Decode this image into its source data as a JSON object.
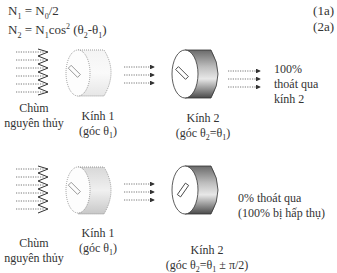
{
  "equations": [
    {
      "lhs": "N",
      "lhs_sub": "1",
      "rhs_a": " = N",
      "rhs_sub": "0",
      "rhs_b": "/2",
      "number": "(1a)"
    },
    {
      "lhs": "N",
      "lhs_sub": "2",
      "rhs_a": " = N",
      "rhs_sub": "1",
      "rhs_b": "cos",
      "sup": "2",
      "rhs_c": " (θ",
      "s2": "2",
      "rhs_d": "-θ",
      "s1": "1",
      "rhs_e": ")",
      "number": "(2a)"
    }
  ],
  "top_scenario": {
    "source_label": [
      "Chùm",
      "nguyên thủy"
    ],
    "filter1_label": [
      "Kính 1",
      "(góc θ",
      "1",
      ")"
    ],
    "filter2_label": [
      "Kính 2",
      "(góc θ",
      "2",
      "=θ",
      "1",
      ")"
    ],
    "result": [
      "100%",
      "thoát qua",
      "kính 2"
    ]
  },
  "bottom_scenario": {
    "source_label": [
      "Chùm",
      "nguyên thủy"
    ],
    "filter1_label": [
      "Kính 1",
      "(góc θ",
      "1",
      ")"
    ],
    "filter2_label": [
      "Kính 2",
      "(góc θ",
      "2",
      "=θ",
      "1",
      " ± π/2)"
    ],
    "result": [
      "0% thoát qua",
      "(100% bị hấp thụ)"
    ]
  },
  "colors": {
    "text": "#333333",
    "arrow": "#333333",
    "filter2_dark": "#555555"
  }
}
